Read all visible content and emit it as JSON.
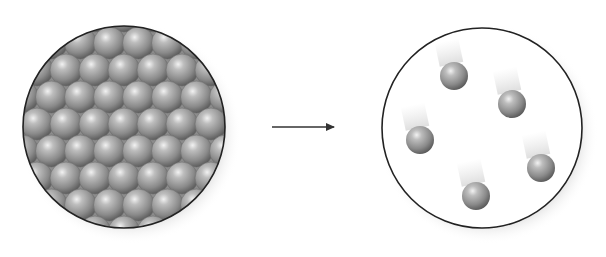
{
  "diagram": {
    "colors": {
      "background": "#ffffff",
      "outline": "#222222",
      "sphere_light": "#d9d9d9",
      "sphere_mid": "#9a9a9a",
      "sphere_dark": "#5e5e5e",
      "shadow": "#bdbdbd",
      "arrow": "#333333"
    },
    "left_panel": {
      "label": "packed-particles",
      "circle": {
        "cx": 124,
        "cy": 127,
        "r": 101
      },
      "lattice": {
        "row_start_y": 16,
        "row_spacing": 27,
        "col_spacing": 29,
        "sphere_r": 16,
        "rows": 9,
        "x_start": 8
      }
    },
    "arrow": {
      "x1": 272,
      "y1": 127,
      "x2": 334,
      "y2": 127
    },
    "right_panel": {
      "label": "dispersed-particles",
      "circle": {
        "cx": 482,
        "cy": 128,
        "r": 100
      },
      "particles": [
        {
          "cx": 454,
          "cy": 76,
          "r": 14
        },
        {
          "cx": 512,
          "cy": 104,
          "r": 14
        },
        {
          "cx": 420,
          "cy": 140,
          "r": 14
        },
        {
          "cx": 541,
          "cy": 168,
          "r": 14
        },
        {
          "cx": 476,
          "cy": 196,
          "r": 14
        }
      ]
    }
  }
}
